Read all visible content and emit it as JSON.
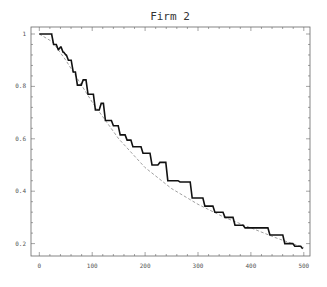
{
  "chart_data": {
    "type": "line",
    "title": "Firm 2",
    "xlabel": "",
    "ylabel": "",
    "xlim": [
      -5,
      512
    ],
    "ylim": [
      0.16,
      1.03
    ],
    "grid": false,
    "legend": null,
    "x_ticks": [
      0,
      100,
      200,
      300,
      400,
      500
    ],
    "x_tick_labels": [
      "0",
      "100",
      "200",
      "300",
      "400",
      "500"
    ],
    "y_ticks": [
      0.2,
      0.4,
      0.6,
      0.8,
      1.0
    ],
    "y_tick_labels": [
      "0.2",
      "0.4",
      "0.6",
      "0.8",
      "1"
    ],
    "series": [
      {
        "name": "empirical (step, solid)",
        "style": "solid-thick",
        "x": [
          0,
          25,
          27,
          36,
          40,
          45,
          50,
          55,
          64,
          72,
          83,
          92,
          106,
          117,
          125,
          140,
          153,
          166,
          177,
          196,
          213,
          228,
          243,
          262,
          266,
          289,
          313,
          332,
          351,
          370,
          389,
          408,
          436,
          464,
          483,
          498
        ],
        "values": [
          1.0,
          1.0,
          0.96,
          0.94,
          0.95,
          0.93,
          0.92,
          0.9,
          0.855,
          0.805,
          0.825,
          0.77,
          0.71,
          0.735,
          0.67,
          0.65,
          0.615,
          0.595,
          0.57,
          0.545,
          0.5,
          0.51,
          0.44,
          0.44,
          0.435,
          0.374,
          0.343,
          0.32,
          0.3,
          0.27,
          0.26,
          0.26,
          0.233,
          0.2,
          0.19,
          0.18
        ]
      },
      {
        "name": "fitted (dashed)",
        "style": "dashed-thin",
        "x": [
          0,
          25,
          50,
          75,
          100,
          150,
          200,
          250,
          300,
          350,
          400,
          450,
          500
        ],
        "values": [
          1.0,
          0.97,
          0.9,
          0.82,
          0.74,
          0.6,
          0.49,
          0.41,
          0.35,
          0.3,
          0.26,
          0.22,
          0.185
        ]
      }
    ]
  }
}
